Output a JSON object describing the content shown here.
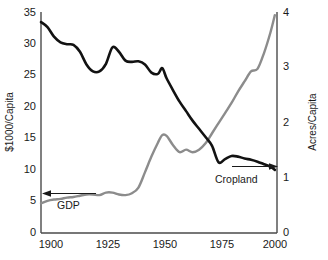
{
  "chart_data": {
    "type": "line",
    "title": "",
    "xlabel": "",
    "ylabel": "$1000/Capita",
    "ylabel_right": "Acres/Capita",
    "grid": false,
    "legend_position": "inline-annotations",
    "xlim": [
      1895,
      2004
    ],
    "ylim": [
      0,
      35
    ],
    "ylim_right": [
      0,
      4
    ],
    "xticks": [
      "1900",
      "1925",
      "1950",
      "1975",
      "2000"
    ],
    "xtick_values": [
      1900,
      1925,
      1950,
      1975,
      2000
    ],
    "yticks_left": [
      "0",
      "5",
      "10",
      "15",
      "20",
      "25",
      "30",
      "35"
    ],
    "ytick_values_left": [
      0,
      5,
      10,
      15,
      20,
      25,
      30,
      35
    ],
    "yticks_right": [
      "0",
      "1",
      "2",
      "3",
      "4"
    ],
    "ytick_values_right": [
      0,
      1,
      2,
      3,
      4
    ],
    "annotations": [
      {
        "text": "GDP",
        "series": "gdp",
        "arrow_direction": "left"
      },
      {
        "text": "Cropland",
        "series": "cropland",
        "arrow_direction": "right"
      }
    ],
    "series": [
      {
        "name": "Cropland",
        "axis": "right",
        "unit": "Acres/Capita",
        "color": "#121212",
        "x": [
          1895,
          1898,
          1901,
          1904,
          1907,
          1910,
          1913,
          1916,
          1919,
          1922,
          1925,
          1928,
          1931,
          1934,
          1937,
          1940,
          1943,
          1946,
          1949,
          1951,
          1953,
          1956,
          1959,
          1962,
          1965,
          1968,
          1971,
          1974,
          1977,
          1980,
          1983,
          1986,
          1989,
          1992,
          1995,
          1998,
          2001,
          2003
        ],
        "values_right_axis": [
          3.81,
          3.72,
          3.55,
          3.45,
          3.42,
          3.4,
          3.28,
          3.05,
          2.93,
          2.92,
          3.06,
          3.36,
          3.28,
          3.12,
          3.1,
          3.11,
          3.05,
          2.9,
          2.88,
          2.98,
          2.8,
          2.58,
          2.38,
          2.2,
          2.03,
          1.88,
          1.74,
          1.58,
          1.28,
          1.34,
          1.39,
          1.38,
          1.35,
          1.32,
          1.29,
          1.25,
          1.2,
          1.14
        ],
        "values_left_scale": [
          33.4,
          32.6,
          31.1,
          30.2,
          29.9,
          29.8,
          28.7,
          26.7,
          25.6,
          25.6,
          26.8,
          29.4,
          28.7,
          27.3,
          27.1,
          27.2,
          26.7,
          25.4,
          25.2,
          26.1,
          24.5,
          22.6,
          20.8,
          19.3,
          17.8,
          16.5,
          15.2,
          13.8,
          11.2,
          11.7,
          12.2,
          12.1,
          11.8,
          11.6,
          11.3,
          10.9,
          10.5,
          10.0
        ]
      },
      {
        "name": "GDP",
        "axis": "left",
        "unit": "$1000/Capita",
        "color": "#8c8c8c",
        "x": [
          1895,
          1898,
          1901,
          1904,
          1907,
          1910,
          1913,
          1916,
          1919,
          1922,
          1925,
          1928,
          1931,
          1934,
          1937,
          1940,
          1943,
          1946,
          1949,
          1951,
          1953,
          1956,
          1959,
          1962,
          1965,
          1968,
          1971,
          1974,
          1977,
          1980,
          1983,
          1986,
          1989,
          1992,
          1995,
          1998,
          2001,
          2003
        ],
        "values_left_axis": [
          4.7,
          5.1,
          5.3,
          5.4,
          5.6,
          5.7,
          5.9,
          6.1,
          6.1,
          6.0,
          6.4,
          6.4,
          6.1,
          6.0,
          6.3,
          7.2,
          9.6,
          12.1,
          14.3,
          15.5,
          15.4,
          13.9,
          12.8,
          13.2,
          12.8,
          13.2,
          14.2,
          15.8,
          17.4,
          19.0,
          20.6,
          22.4,
          24.0,
          25.6,
          26.0,
          28.5,
          31.8,
          34.5
        ],
        "values_right_scale": [
          0.54,
          0.58,
          0.61,
          0.62,
          0.64,
          0.65,
          0.67,
          0.7,
          0.7,
          0.69,
          0.73,
          0.73,
          0.7,
          0.69,
          0.72,
          0.82,
          1.1,
          1.38,
          1.63,
          1.77,
          1.76,
          1.59,
          1.46,
          1.51,
          1.46,
          1.51,
          1.62,
          1.81,
          1.99,
          2.17,
          2.35,
          2.56,
          2.74,
          2.93,
          2.97,
          3.26,
          3.63,
          3.94
        ]
      }
    ]
  },
  "axes": {
    "left_title": "$1000/Capita",
    "right_title": "Acres/Capita"
  },
  "labels": {
    "gdp": "GDP",
    "cropland": "Cropland"
  },
  "colors": {
    "cropland_line": "#121212",
    "gdp_line": "#8c8c8c",
    "axis": "#4a4a4a",
    "text": "#1a1a1a",
    "background": "#ffffff"
  }
}
